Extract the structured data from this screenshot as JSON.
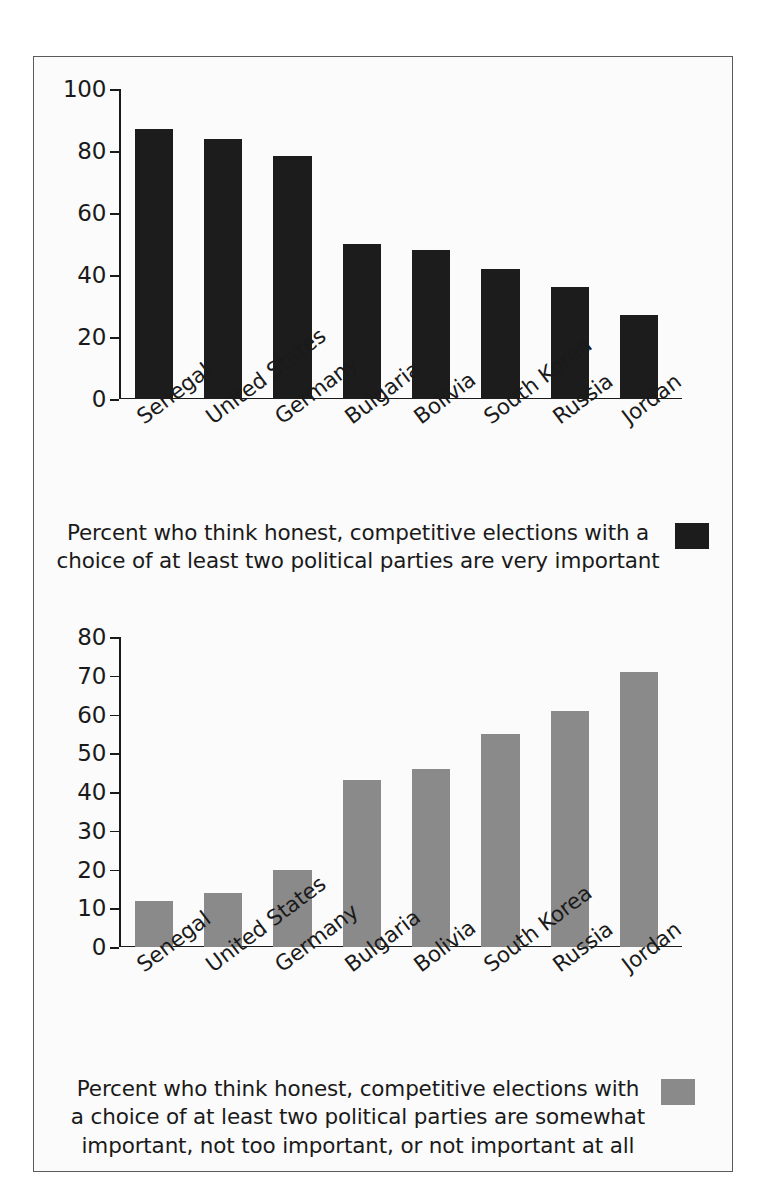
{
  "chart_data": [
    {
      "type": "bar",
      "panel": "top",
      "title": "",
      "categories": [
        "Senegal",
        "United States",
        "Germany",
        "Bulgaria",
        "Bolivia",
        "South Korea",
        "Russia",
        "Jordan"
      ],
      "values": [
        87,
        84,
        78.5,
        50,
        48,
        42,
        36,
        27
      ],
      "series": [
        {
          "name": "Percent who think honest, competitive elections with a choice of at least two political parties are very important",
          "values": [
            87,
            84,
            78.5,
            50,
            48,
            42,
            36,
            27
          ],
          "color": "#1c1c1c"
        }
      ],
      "xlabel": "",
      "ylabel": "",
      "ylim": [
        0,
        100
      ],
      "yticks": [
        0,
        20,
        40,
        60,
        80,
        100
      ],
      "grid": false,
      "legend_position": "bottom",
      "legend_text": "Percent who think honest, competitive elections with a choice of at least two political parties are very important"
    },
    {
      "type": "bar",
      "panel": "bottom",
      "title": "",
      "categories": [
        "Senegal",
        "United States",
        "Germany",
        "Bulgaria",
        "Bolivia",
        "South Korea",
        "Russia",
        "Jordan"
      ],
      "values": [
        12,
        14,
        20,
        43,
        46,
        55,
        61,
        71
      ],
      "series": [
        {
          "name": "Percent who think honest, competitive elections with a choice of at least two political parties are somewhat important, not too important, or not important at all",
          "values": [
            12,
            14,
            20,
            43,
            46,
            55,
            61,
            71
          ],
          "color": "#8a8a8a"
        }
      ],
      "xlabel": "",
      "ylabel": "",
      "ylim": [
        0,
        80
      ],
      "yticks": [
        0,
        10,
        20,
        30,
        40,
        50,
        60,
        70,
        80
      ],
      "grid": false,
      "legend_position": "bottom",
      "legend_text": "Percent who think honest, competitive elections with a choice of at least two political parties are somewhat important, not too important, or not important at all"
    }
  ],
  "top_panel": {
    "yticks": [
      "100",
      "80",
      "60",
      "40",
      "20",
      "0"
    ],
    "categories": [
      "Senegal",
      "United States",
      "Germany",
      "Bulgaria",
      "Bolivia",
      "South Korea",
      "Russia",
      "Jordan"
    ],
    "legend": {
      "line1": "Percent who think honest, competitive elections with a",
      "line2": "choice of at least two political parties are very important",
      "swatch_color": "#1c1c1c"
    }
  },
  "bottom_panel": {
    "yticks": [
      "80",
      "70",
      "60",
      "50",
      "40",
      "30",
      "20",
      "10",
      "0"
    ],
    "categories": [
      "Senegal",
      "United States",
      "Germany",
      "Bulgaria",
      "Bolivia",
      "South Korea",
      "Russia",
      "Jordan"
    ],
    "legend": {
      "line1": "Percent who think honest, competitive elections with",
      "line2": "a choice of at least two political parties are somewhat",
      "line3": "important, not too important, or not important at all",
      "swatch_color": "#8a8a8a"
    }
  }
}
